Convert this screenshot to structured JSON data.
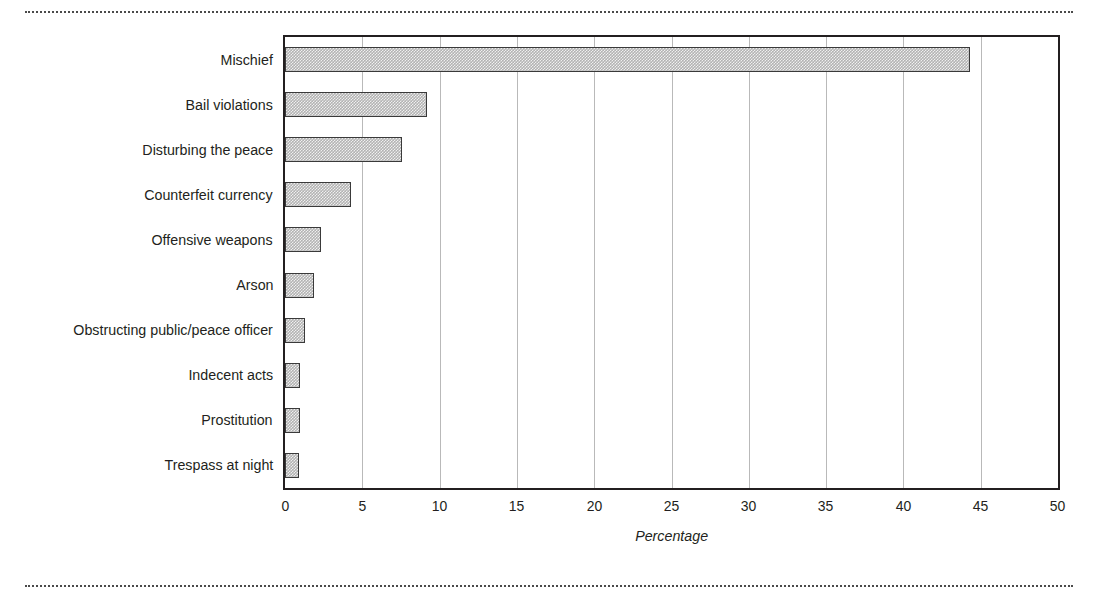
{
  "chart_data": {
    "type": "bar",
    "orientation": "horizontal",
    "title": "",
    "xlabel": "Percentage",
    "ylabel": "",
    "xlim": [
      0,
      50
    ],
    "xticks": [
      "0",
      "5",
      "10",
      "15",
      "20",
      "25",
      "30",
      "35",
      "40",
      "45",
      "50"
    ],
    "grid": "vertical",
    "legend": "none",
    "categories": [
      "Mischief",
      "Bail violations",
      "Disturbing the peace",
      "Counterfeit currency",
      "Offensive weapons",
      "Arson",
      "Obstructing public/peace officer",
      "Indecent acts",
      "Prostitution",
      "Trespass at night"
    ],
    "values": [
      44.3,
      9.2,
      7.6,
      4.3,
      2.3,
      1.9,
      1.3,
      1.0,
      0.95,
      0.9
    ],
    "bar_fill_color": "#b3b3b3",
    "bar_edge_color": "#3a3a3a",
    "gridline_color": "#b9b9b9",
    "frame_color": "#231f20"
  },
  "decorations": {
    "rule_top": "dotted-rule",
    "rule_bottom": "dotted-rule"
  }
}
